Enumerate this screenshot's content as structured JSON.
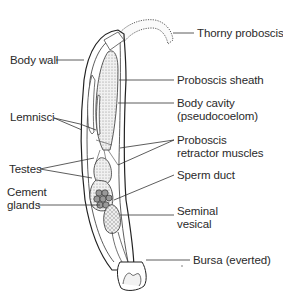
{
  "diagram": {
    "labels": {
      "thorny_proboscis": "Thorny proboscis",
      "body_wall": "Body wall",
      "proboscis_sheath": "Proboscis sheath",
      "body_cavity_1": "Body cavity",
      "body_cavity_2": "(pseudocoelom)",
      "lemnisci": "Lemnisci",
      "proboscis_retractor_1": "Proboscis",
      "proboscis_retractor_2": "retractor muscles",
      "testes": "Testes",
      "sperm_duct": "Sperm duct",
      "cement_glands_1": "Cement",
      "cement_glands_2": "glands",
      "seminal_vesical_1": "Seminal",
      "seminal_vesical_2": "vesical",
      "bursa": "Bursa (everted)"
    },
    "colors": {
      "line": "#222222",
      "background": "#ffffff",
      "stipple": "#e6e6e6"
    }
  }
}
